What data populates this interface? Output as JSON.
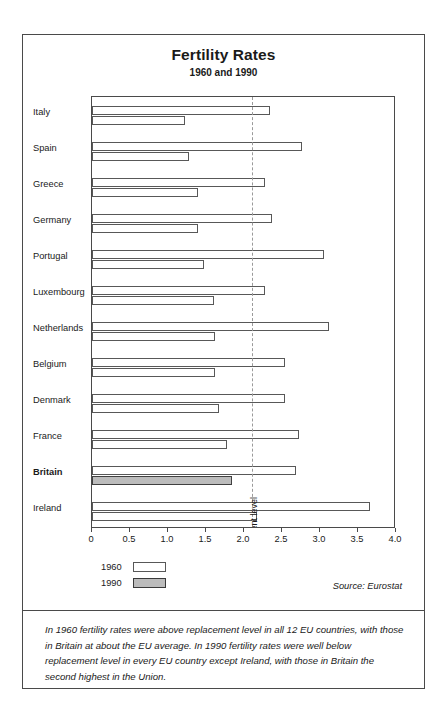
{
  "chart_data": {
    "type": "bar",
    "orientation": "horizontal",
    "title": "Fertility Rates",
    "subtitle": "1960 and 1990",
    "xlabel": "",
    "ylabel": "",
    "xlim": [
      0,
      4.0
    ],
    "xticks": [
      "0",
      "0.5",
      "1.0",
      "1.5",
      "2.0",
      "2.5",
      "3.0",
      "3.5",
      "4.0"
    ],
    "xtick_values": [
      0,
      0.5,
      1.0,
      1.5,
      2.0,
      2.5,
      3.0,
      3.5,
      4.0
    ],
    "grid": false,
    "legend_position": "below-left",
    "categories": [
      "Italy",
      "Spain",
      "Greece",
      "Germany",
      "Portugal",
      "Luxembourg",
      "Netherlands",
      "Belgium",
      "Denmark",
      "France",
      "Britain",
      "Ireland"
    ],
    "highlight_category": "Britain",
    "series": [
      {
        "name": "1960",
        "values": [
          2.34,
          2.76,
          2.28,
          2.37,
          3.05,
          2.28,
          3.12,
          2.54,
          2.54,
          2.73,
          2.69,
          3.66
        ]
      },
      {
        "name": "1990",
        "values": [
          1.22,
          1.27,
          1.4,
          1.39,
          1.47,
          1.61,
          1.62,
          1.62,
          1.67,
          1.78,
          1.84,
          2.17
        ]
      }
    ],
    "annotations": [
      {
        "name": "replacement-level",
        "label": "Replacement level",
        "value": 2.1,
        "style": "dashed-vertical-line"
      }
    ],
    "source": "Source: Eurostat"
  },
  "legend": {
    "items": [
      {
        "label": "1960",
        "swatch": "outline"
      },
      {
        "label": "1990",
        "swatch": "filled"
      }
    ]
  },
  "colors": {
    "frame": "#4a4a4a",
    "bar_1960_fill": "#ffffff",
    "bar_1990_fill": "#ffffff",
    "bar_highlight_fill": "#bcbcbc",
    "bar_stroke": "#585858",
    "replacement_line": "#9a9a9a",
    "text": "#1a1a1a",
    "background": "#ffffff"
  },
  "caption": {
    "text": "In 1960 fertility rates were above replacement level in all 12 EU countries, with those in Britain at about the EU average. In 1990 fertility rates were well below replacement level in every EU country except Ireland, with those in Britain the second highest in the Union."
  }
}
